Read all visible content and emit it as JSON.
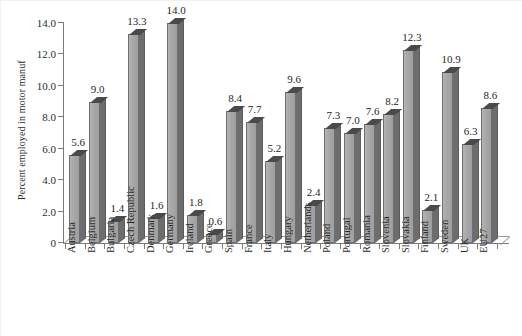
{
  "chart_data": {
    "type": "bar",
    "title": "",
    "xlabel": "",
    "ylabel": "Percent employed in motor manuf",
    "ylim": [
      0,
      14.0
    ],
    "ytick_labels": [
      "0",
      "2.0",
      "4.0",
      "6.0",
      "8.0",
      "10.0",
      "12.0",
      "14.0"
    ],
    "ytick_values": [
      0,
      2.0,
      4.0,
      6.0,
      8.0,
      10.0,
      12.0,
      14.0
    ],
    "grid": false,
    "legend": null,
    "data_labels": true,
    "style_note": "3d-shaded-gray-bars",
    "categories": [
      "Austria",
      "Belgium",
      "Bulgaria",
      "Czech Republic",
      "Denmark",
      "Germany",
      "Ireland",
      "Greece",
      "Spain",
      "France",
      "Italy",
      "Hungary",
      "Netherlands",
      "Poland",
      "Portugal",
      "Romania",
      "Slovenia",
      "Slovakia",
      "Finland",
      "Sweden",
      "UK",
      "EU27"
    ],
    "values": [
      5.6,
      9.0,
      1.4,
      13.3,
      1.6,
      14.0,
      1.8,
      0.6,
      8.4,
      7.7,
      5.2,
      9.6,
      2.4,
      7.3,
      7.0,
      7.6,
      8.2,
      12.3,
      2.1,
      10.9,
      6.3,
      8.6
    ],
    "value_labels": [
      "5.6",
      "9.0",
      "1.4",
      "13.3",
      "1.6",
      "14.0",
      "1.8",
      "0.6",
      "8.4",
      "7.7",
      "5.2",
      "9.6",
      "2.4",
      "7.3",
      "7.0",
      "7.6",
      "8.2",
      "12.3",
      "2.1",
      "10.9",
      "6.3",
      "8.6"
    ],
    "colors": {
      "bar_front": "#a9a9a9",
      "bar_side": "#6d6d6d",
      "bar_top": "#4a4a4a",
      "bar_outline": "#6f6f6f",
      "axis": "#7b7b7b",
      "text": "#2b2b2b",
      "background": "#ffffff"
    }
  }
}
